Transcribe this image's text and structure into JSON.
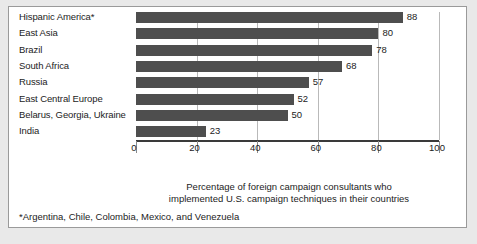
{
  "chart_data": {
    "type": "bar",
    "orientation": "horizontal",
    "title": "",
    "subtitle": "",
    "xlabel": "Percentage of foreign campaign consultants who implemented U.S. campaign techniques in their countries",
    "ylabel": "",
    "xlim": [
      0,
      100
    ],
    "xticks": [
      0,
      20,
      40,
      60,
      80,
      100
    ],
    "xtick_labels": [
      "0",
      "20",
      "40",
      "60",
      "80",
      "100"
    ],
    "grid": true,
    "grid_axis": "x",
    "legend": false,
    "categories": [
      "Hispanic America*",
      "East Asia",
      "Brazil",
      "South Africa",
      "Russia",
      "East Central Europe",
      "Belarus, Georgia, Ukraine",
      "India"
    ],
    "values": [
      88,
      80,
      78,
      68,
      57,
      52,
      50,
      23
    ],
    "data_labels": [
      "88",
      "80",
      "78",
      "68",
      "57",
      "52",
      "50",
      "23"
    ],
    "bar_color": "#4e4e4e",
    "grid_color": "#b9b9b9",
    "axis_color": "#3a3a3a",
    "background_color": "#ffffff",
    "page_background_color": "#e9e9e9",
    "annotations": [
      "*Argentina, Chile, Colombia, Mexico, and Venezuela"
    ]
  },
  "axis_caption": {
    "line1": "Percentage of foreign campaign consultants who",
    "line2": "implemented U.S. campaign techniques in their countries"
  },
  "footnote": {
    "text": "*Argentina, Chile, Colombia, Mexico, and Venezuela"
  }
}
